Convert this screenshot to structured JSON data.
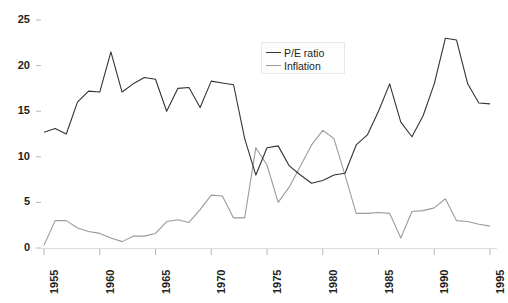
{
  "chart_data": {
    "type": "line",
    "title": "",
    "subtitle": "",
    "xlabel": "",
    "ylabel": "",
    "xlim": [
      1955,
      1995
    ],
    "ylim": [
      0,
      25
    ],
    "yticks": [
      0,
      5,
      10,
      15,
      20,
      25
    ],
    "xticks": [
      1955,
      1960,
      1965,
      1970,
      1975,
      1980,
      1985,
      1990,
      1995
    ],
    "grid": false,
    "legend_position": "top-center",
    "x": [
      1955,
      1956,
      1957,
      1958,
      1959,
      1960,
      1961,
      1962,
      1963,
      1964,
      1965,
      1966,
      1967,
      1968,
      1969,
      1970,
      1971,
      1972,
      1973,
      1974,
      1975,
      1976,
      1977,
      1978,
      1979,
      1980,
      1981,
      1982,
      1983,
      1984,
      1985,
      1986,
      1987,
      1988,
      1989,
      1990,
      1991,
      1992,
      1993,
      1994,
      1995
    ],
    "series": [
      {
        "name": "P/E ratio",
        "color": "#333333",
        "values": [
          12.7,
          13.1,
          12.5,
          16.0,
          17.2,
          17.1,
          21.5,
          17.1,
          18.0,
          18.7,
          18.5,
          15.0,
          17.5,
          17.6,
          15.4,
          18.3,
          18.1,
          17.9,
          12.0,
          8.0,
          11.0,
          11.2,
          9.0,
          8.0,
          7.1,
          7.4,
          8.0,
          8.2,
          11.3,
          12.4,
          15.0,
          18.0,
          13.8,
          12.2,
          14.5,
          18.0,
          23.0,
          22.8,
          18.0,
          15.9,
          15.8
        ]
      },
      {
        "name": "Inflation",
        "color": "#9b9b9b",
        "values": [
          0.3,
          3.0,
          3.0,
          2.2,
          1.8,
          1.6,
          1.1,
          0.7,
          1.3,
          1.3,
          1.6,
          2.9,
          3.1,
          2.8,
          4.2,
          5.8,
          5.7,
          3.3,
          3.3,
          11.0,
          9.1,
          5.0,
          6.7,
          9.0,
          11.3,
          12.9,
          12.0,
          8.0,
          3.8,
          3.8,
          3.9,
          3.8,
          1.1,
          4.0,
          4.1,
          4.4,
          5.4,
          3.0,
          2.9,
          2.6,
          2.4
        ]
      }
    ]
  },
  "legend": {
    "items": [
      {
        "label": "P/E ratio"
      },
      {
        "label": "Inflation"
      }
    ]
  },
  "axis": {
    "y_labels": [
      "0",
      "5",
      "10",
      "15",
      "20",
      "25"
    ],
    "x_labels": [
      "1955",
      "1960",
      "1965",
      "1970",
      "1975",
      "1980",
      "1985",
      "1990",
      "1995"
    ]
  },
  "colors": {
    "background": "#ffffff",
    "axis_line": "#d8d8d8",
    "tick": "#b8b8b8",
    "text": "#231f20",
    "pe_line": "#333333",
    "inflation_line": "#9b9b9b"
  }
}
